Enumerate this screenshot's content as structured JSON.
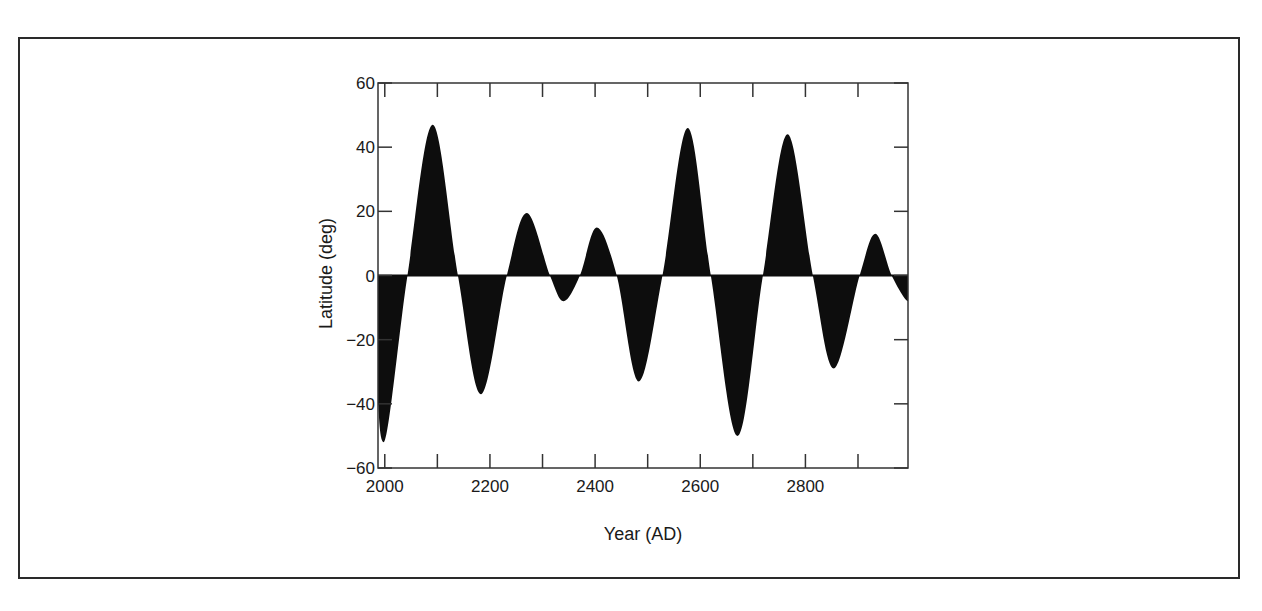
{
  "chart_data": {
    "type": "area",
    "title": "",
    "xlabel": "Year (AD)",
    "ylabel": "Latitude (deg)",
    "xlim": [
      1989,
      2997
    ],
    "ylim": [
      -60,
      60
    ],
    "grid": false,
    "legend": null,
    "x_ticks": [
      2000,
      2100,
      2200,
      2300,
      2400,
      2500,
      2600,
      2700,
      2800,
      2900
    ],
    "x_tick_labels": [
      "2000",
      "",
      "2200",
      "",
      "2400",
      "",
      "2600",
      "",
      "2800",
      ""
    ],
    "y_ticks": [
      60,
      40,
      20,
      0,
      -20,
      -40,
      -60
    ],
    "y_tick_labels": [
      "60",
      "40",
      "20",
      "0",
      "−20",
      "−40",
      "−60"
    ],
    "fill_to_zero": true,
    "fill_color": "#0d0d0d",
    "series": [
      {
        "name": "Latitude",
        "x": [
          1989,
          2000,
          2045,
          2093,
          2141,
          2185,
          2234,
          2272,
          2316,
          2342,
          2373,
          2405,
          2443,
          2485,
          2530,
          2578,
          2622,
          2673,
          2721,
          2768,
          2816,
          2856,
          2905,
          2935,
          2966,
          2997
        ],
        "y": [
          -40,
          -52,
          0,
          47,
          0,
          -37,
          0,
          19.5,
          0,
          -8,
          0,
          15,
          0,
          -33,
          0,
          46,
          0,
          -50,
          0,
          44,
          0,
          -29,
          0,
          13,
          0,
          -8
        ]
      }
    ]
  }
}
